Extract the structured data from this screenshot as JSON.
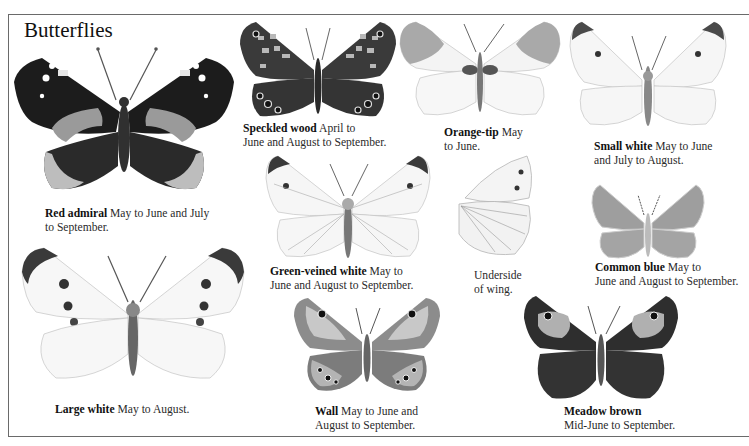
{
  "page": {
    "title": "Butterflies",
    "frame_color": "#6a6a6a"
  },
  "species": [
    {
      "id": "red-admiral",
      "name": "Red admiral",
      "line1": " May to June and July",
      "line2": "to September.",
      "colors": {
        "fore": "#1c1c1c",
        "hind": "#2a2a2a",
        "band": "#9a9a9a",
        "border": "#bdbdbd"
      }
    },
    {
      "id": "speckled-wood",
      "name": "Speckled wood",
      "line1": " April to",
      "line2": "June and August to September.",
      "colors": {
        "wing": "#3a3a3a",
        "spots": "#b8b8b8"
      }
    },
    {
      "id": "orange-tip",
      "name": "Orange-tip",
      "line1": " May",
      "line2": "to June.",
      "colors": {
        "wing": "#f4f4f4",
        "tip": "#a9a9a9"
      }
    },
    {
      "id": "small-white",
      "name": "Small white",
      "line1": " May to June",
      "line2": "and July to August.",
      "colors": {
        "wing": "#f6f6f6",
        "tip": "#4a4a4a"
      }
    },
    {
      "id": "green-veined-white",
      "name": "Green-veined white",
      "line1": " May to",
      "line2": "June and August to September.",
      "colors": {
        "wing": "#f6f6f6",
        "tip": "#3a3a3a"
      }
    },
    {
      "id": "underside-of-wing",
      "name": "",
      "line1": "Underside",
      "line2": "of wing.",
      "colors": {
        "wing": "#f2f2f2"
      }
    },
    {
      "id": "common-blue",
      "name": "Common blue",
      "line1": " May to",
      "line2": "June and August to September.",
      "colors": {
        "wing": "#9e9e9e"
      }
    },
    {
      "id": "large-white",
      "name": "Large white",
      "line1": " May to August.",
      "line2": "",
      "colors": {
        "wing": "#f7f7f7",
        "tip": "#3a3a3a"
      }
    },
    {
      "id": "wall",
      "name": "Wall",
      "line1": " May to June and",
      "line2": "August to September.",
      "colors": {
        "wing": "#8c8c8c",
        "light": "#c8c8c8",
        "dark": "#4a4a4a"
      }
    },
    {
      "id": "meadow-brown",
      "name": "Meadow brown",
      "line1": "",
      "line2": "Mid-June to September.",
      "colors": {
        "wing": "#2e2e2e",
        "patch": "#b0b0b0"
      }
    }
  ]
}
